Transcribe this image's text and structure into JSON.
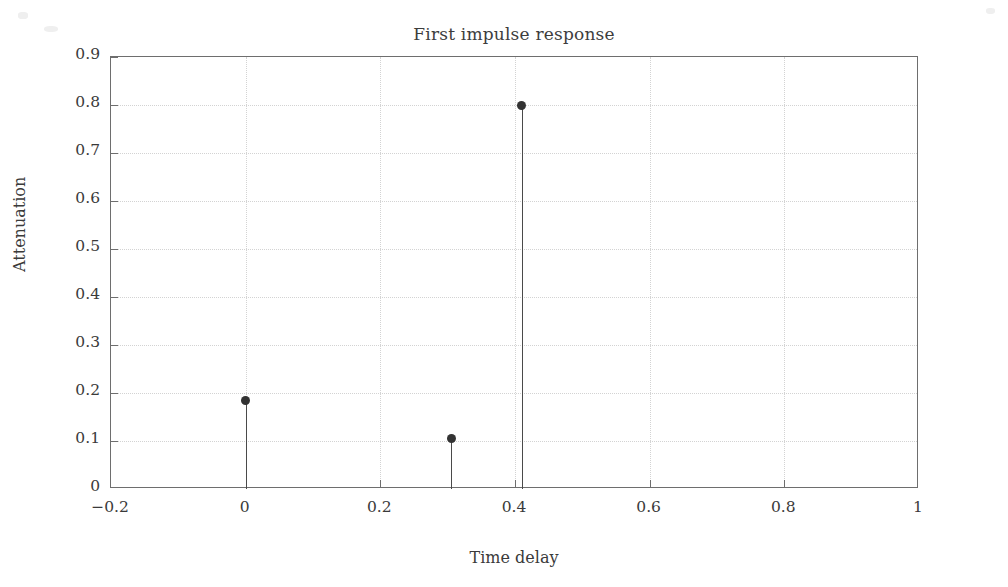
{
  "chart_data": {
    "type": "scatter",
    "plot_style": "stem",
    "title": "First impulse response",
    "xlabel": "Time delay",
    "ylabel": "Attenuation",
    "xlim": [
      -0.2,
      1.0
    ],
    "ylim": [
      0.0,
      0.9
    ],
    "xticks": [
      -0.2,
      0,
      0.2,
      0.4,
      0.6,
      0.8,
      1
    ],
    "xticklabels": [
      "−0.2",
      "0",
      "0.2",
      "0.4",
      "0.6",
      "0.8",
      "1"
    ],
    "yticks": [
      0,
      0.1,
      0.2,
      0.3,
      0.4,
      0.5,
      0.6,
      0.7,
      0.8,
      0.9
    ],
    "yticklabels": [
      "0",
      "0.1",
      "0.2",
      "0.3",
      "0.4",
      "0.5",
      "0.6",
      "0.7",
      "0.8",
      "0.9"
    ],
    "grid": true,
    "grid_style": "dotted",
    "legend": null,
    "x": [
      0.0,
      0.305,
      0.41
    ],
    "values": [
      0.185,
      0.105,
      0.8
    ],
    "points": [
      {
        "x": 0.0,
        "y": 0.185
      },
      {
        "x": 0.305,
        "y": 0.105
      },
      {
        "x": 0.41,
        "y": 0.8
      }
    ],
    "colors": {
      "stem": "#4a4a4a",
      "marker": "#333333",
      "grid": "#d3d3d3",
      "axis": "#6e6e6e",
      "text": "#3a3a3a",
      "background": "#ffffff"
    }
  }
}
